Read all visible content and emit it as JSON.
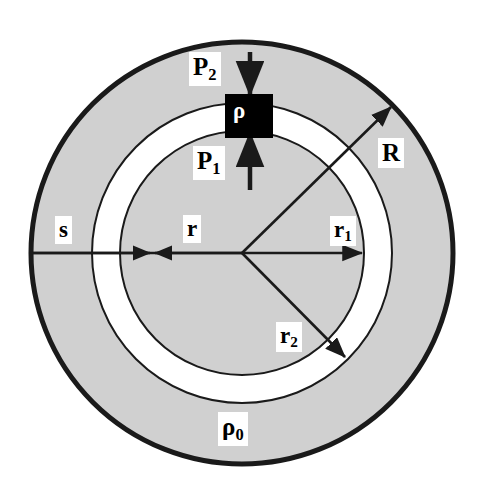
{
  "figure": {
    "type": "physics-cross-section-diagram"
  },
  "labels": {
    "pressure_upper": "P",
    "pressure_upper_sub": "2",
    "pressure_lower": "P",
    "pressure_lower_sub": "1",
    "mass_element": "ρ",
    "outer_radius": "R",
    "shell_thickness": "s",
    "radius_generic": "r",
    "inner_shell_radius": "r",
    "inner_shell_radius_sub": "1",
    "outer_shell_radius": "r",
    "outer_shell_radius_sub": "2",
    "background_density": "ρ",
    "background_density_sub": "0"
  },
  "colors": {
    "background": "#ffffff",
    "medium_fill": "#d0d0d0",
    "cavity_fill": "#ffffff",
    "stroke": "#1a1a1a",
    "mass_element_fill": "#000000",
    "mass_element_text": "#ffffff"
  },
  "geometry": {
    "center_x": 242,
    "center_y": 253,
    "outer_radius_R": 211,
    "shell_outer_radius_r2": 150,
    "shell_inner_radius_r1": 122,
    "outer_stroke_width": 5,
    "inner_stroke_width": 2
  },
  "arrows": {
    "P2": {
      "label": "P2-down-arrow",
      "direction": "down",
      "x": 250,
      "y_start": 52,
      "y_end": 97
    },
    "P1": {
      "label": "P1-up-arrow",
      "direction": "up",
      "x": 250,
      "y_start": 188,
      "y_end": 134
    },
    "R": {
      "label": "R-radius-arrow",
      "angle_deg": -45,
      "from_center": true,
      "to_radius": 211
    },
    "s": {
      "label": "s-span-arrow",
      "direction": "right",
      "x_start": 32,
      "x_end": 152,
      "y": 253
    },
    "r": {
      "label": "r-span-arrow",
      "direction": "left",
      "x_start": 242,
      "x_end": 152,
      "y": 253
    },
    "r1": {
      "label": "r1-radius-arrow",
      "direction": "right",
      "x_start": 242,
      "x_end": 364,
      "y": 253
    },
    "r2": {
      "label": "r2-radius-arrow",
      "angle_deg": 45,
      "from_center": true,
      "to_radius": 150
    }
  }
}
